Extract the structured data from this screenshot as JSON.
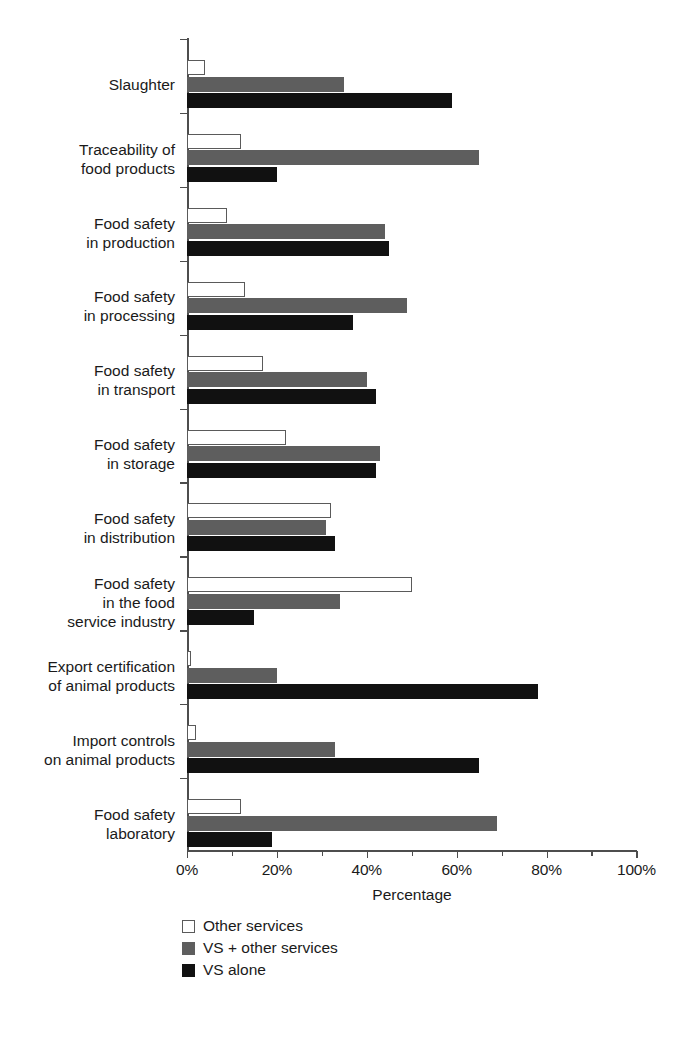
{
  "chart_data": {
    "type": "bar",
    "orientation": "horizontal",
    "title": "",
    "xlabel": "Percentage",
    "ylabel": "",
    "xlim": [
      0,
      100
    ],
    "xticks": [
      0,
      20,
      40,
      60,
      80,
      100
    ],
    "xticklabels": [
      "0%",
      "20%",
      "40%",
      "60%",
      "80%",
      "100%"
    ],
    "xtick_minor": [
      10,
      30,
      50,
      70,
      90
    ],
    "grid": false,
    "legend_position": "bottom-left",
    "categories": [
      "Slaughter",
      "Traceability of\nfood products",
      "Food safety\nin production",
      "Food safety\nin processing",
      "Food safety\nin transport",
      "Food safety\nin storage",
      "Food safety\nin distribution",
      "Food safety\nin the food\nservice industry",
      "Export certification\nof animal products",
      "Import controls\non animal products",
      "Food safety\nlaboratory"
    ],
    "series": [
      {
        "name": "Other services",
        "color": "#ffffff",
        "edge_color": "#5a5a5a",
        "values": [
          4,
          12,
          9,
          13,
          17,
          22,
          32,
          50,
          1,
          2,
          12
        ]
      },
      {
        "name": "VS + other services",
        "color": "#5e5e5e",
        "values": [
          35,
          65,
          44,
          49,
          40,
          43,
          31,
          34,
          20,
          33,
          69
        ]
      },
      {
        "name": "VS alone",
        "color": "#111111",
        "values": [
          59,
          20,
          45,
          37,
          42,
          42,
          33,
          15,
          78,
          65,
          19
        ]
      }
    ]
  },
  "legend": {
    "items": [
      {
        "label": "Other services",
        "swatch": "other"
      },
      {
        "label": "VS + other services",
        "swatch": "vsother"
      },
      {
        "label": "VS alone",
        "swatch": "vsalone"
      }
    ]
  }
}
